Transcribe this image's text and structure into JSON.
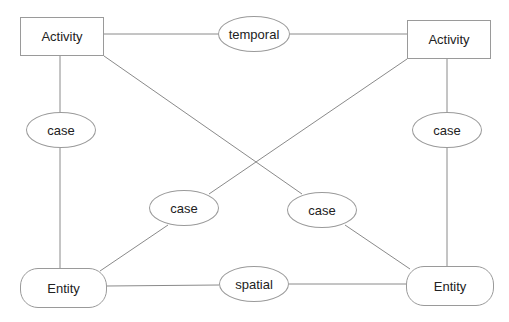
{
  "diagram": {
    "line_color": "#8a8a8a",
    "nodes": {
      "activity_left": {
        "label": "Activity",
        "shape": "rectangle"
      },
      "activity_right": {
        "label": "Activity",
        "shape": "rectangle"
      },
      "temporal": {
        "label": "temporal",
        "shape": "ellipse"
      },
      "case_left": {
        "label": "case",
        "shape": "ellipse"
      },
      "case_right": {
        "label": "case",
        "shape": "ellipse"
      },
      "case_mid_left": {
        "label": "case",
        "shape": "ellipse"
      },
      "case_mid_right": {
        "label": "case",
        "shape": "ellipse"
      },
      "entity_left": {
        "label": "Entity",
        "shape": "rounded-rectangle"
      },
      "entity_right": {
        "label": "Entity",
        "shape": "rounded-rectangle"
      },
      "spatial": {
        "label": "spatial",
        "shape": "ellipse"
      }
    },
    "edges": [
      {
        "from": "activity_left",
        "to": "temporal"
      },
      {
        "from": "temporal",
        "to": "activity_right"
      },
      {
        "from": "activity_left",
        "to": "case_left"
      },
      {
        "from": "case_left",
        "to": "entity_left"
      },
      {
        "from": "activity_right",
        "to": "case_right"
      },
      {
        "from": "case_right",
        "to": "entity_right"
      },
      {
        "from": "activity_left",
        "to": "case_mid_right"
      },
      {
        "from": "case_mid_right",
        "to": "entity_right"
      },
      {
        "from": "activity_right",
        "to": "case_mid_left"
      },
      {
        "from": "case_mid_left",
        "to": "entity_left"
      },
      {
        "from": "entity_left",
        "to": "spatial"
      },
      {
        "from": "spatial",
        "to": "entity_right"
      }
    ]
  }
}
